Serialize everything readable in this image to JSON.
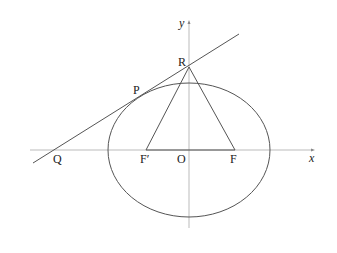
{
  "diagram": {
    "type": "ellipse-tangent-geometry",
    "axes": {
      "x_label": "x",
      "y_label": "y",
      "origin_label": "O"
    },
    "points": {
      "R": "R",
      "P": "P",
      "Q": "Q",
      "F_prime": "F′",
      "F": "F"
    },
    "shapes": [
      "ellipse centered at origin",
      "tangent line through Q, P, R",
      "triangle R-F′-F"
    ],
    "colors": {
      "stroke": "#555555",
      "axis": "#999999",
      "text": "#222222"
    }
  }
}
